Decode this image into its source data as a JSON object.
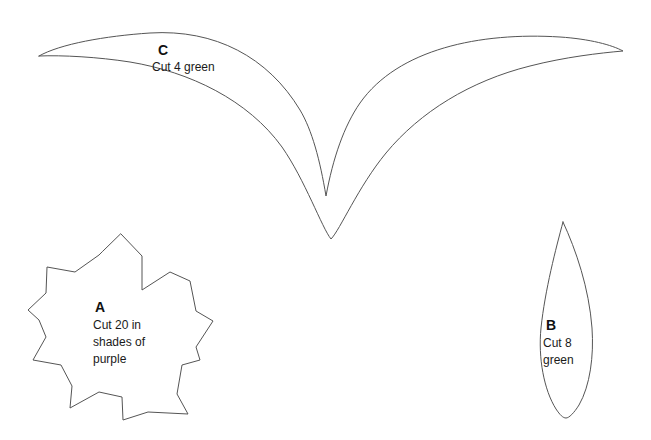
{
  "sheet": {
    "background_color": "#ffffff",
    "stroke_color": "#555555",
    "text_color": "#111111",
    "width": 651,
    "height": 440
  },
  "pieces": [
    {
      "id": "piece-c",
      "letter": "C",
      "instruction_lines": [
        "Cut 4 green"
      ],
      "instruction_text": "Cut 4 green",
      "quantity": 4,
      "material": "green",
      "shape": "double-curve-calyx",
      "label_x": 158,
      "label_y": 55,
      "text_x": 152,
      "text_y": 71
    },
    {
      "id": "piece-a",
      "letter": "A",
      "instruction_lines": [
        "Cut 20 in",
        "shades of",
        "purple"
      ],
      "instruction_text": "Cut 20 in shades of purple",
      "quantity": 20,
      "material": "shades of purple",
      "shape": "six-petal-flower",
      "label_x": 95,
      "label_y": 312,
      "text_x": 93,
      "text_y": 329
    },
    {
      "id": "piece-b",
      "letter": "B",
      "instruction_lines": [
        "Cut 8",
        "green"
      ],
      "instruction_text": "Cut 8 green",
      "quantity": 8,
      "material": "green",
      "shape": "teardrop-leaf",
      "label_x": 546,
      "label_y": 330,
      "text_x": 543,
      "text_y": 347
    }
  ],
  "geometry": {
    "piece_c_path": "M 39 56 C 60 44 105 36 150 33 C 215 29 268 57 300 110 C 312 130 320 160 326 196 C 333 158 344 126 360 103 C 398 49 480 32 560 37 C 590 39 612 45 623 51 C 600 53 565 57 530 66 C 470 81 420 112 386 153 C 358 187 340 230 331 239 C 322 228 305 180 282 147 C 248 100 190 72 130 62 C 98 57 62 55 39 56 Z",
    "piece_a_path": "M 121 234 L 142 256 L 142 290 L 170 272 L 190 281 L 196 311 L 213 321 L 196 347 L 200 360 L 182 365 L 177 394 L 188 414 L 148 412 L 123 420 L 122 397 L 99 392 L 70 408 L 72 386 L 61 365 L 33 360 L 46 337 L 39 320 L 28 310 L 46 293 L 47 267 L 75 272 L 99 255 L 102 252 Z",
    "piece_b_path": "M 563 222 C 556 248 545 290 541 328 C 538 358 544 390 556 409 C 560 415 563 418 566 418 C 569 418 574 413 579 405 C 590 386 594 356 592 328 C 589 288 576 250 563 222 Z"
  }
}
